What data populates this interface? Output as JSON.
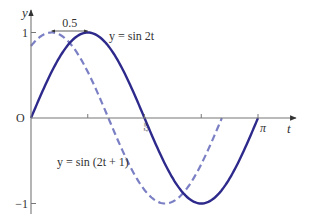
{
  "chart_data": {
    "type": "line",
    "title": "",
    "xlabel": "t",
    "ylabel": "y",
    "xlim": [
      0,
      3.6
    ],
    "ylim": [
      -1.15,
      1.15
    ],
    "grid": false,
    "x_ticks": [
      {
        "value": 0.7854,
        "label": ""
      },
      {
        "value": 1.5708,
        "label": "π/2"
      },
      {
        "value": 2.3562,
        "label": ""
      },
      {
        "value": 3.1416,
        "label": "π"
      }
    ],
    "y_ticks": [
      {
        "value": 1,
        "label": "1"
      },
      {
        "value": -1,
        "label": "−1"
      }
    ],
    "origin_label": "O",
    "series": [
      {
        "name": "y = sin 2t",
        "expression": "sin(2t)",
        "t_range": [
          0,
          3.1416
        ],
        "style": "solid",
        "color": "#2e2a8c",
        "label": "y = sin 2t",
        "label_near": "top-right of first peak"
      },
      {
        "name": "y = sin (2t + 1)",
        "expression": "sin(2t + 1)",
        "t_range": [
          0,
          2.6416
        ],
        "style": "dashed",
        "color": "#7b7fc4",
        "label": "y = sin (2t + 1)",
        "label_near": "left-middle below axis"
      }
    ],
    "annotations": [
      {
        "text": "0.5",
        "type": "double-arrow",
        "from_t": 0.2854,
        "to_t": 0.7854,
        "y": 1.12
      }
    ]
  }
}
